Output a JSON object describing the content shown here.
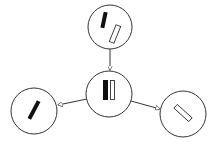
{
  "diagram": {
    "type": "replication-split",
    "colors": {
      "stroke": "#333333",
      "filled": "#111111",
      "hollow": "#ffffff",
      "background": "#ffffff"
    },
    "nodes": [
      {
        "id": "top",
        "cx": 110,
        "cy": 27,
        "r": 22,
        "contents": [
          "filled-bar-tilted",
          "hollow-bar-tilted"
        ]
      },
      {
        "id": "center",
        "cx": 109,
        "cy": 94,
        "r": 23,
        "contents": [
          "filled-bar-vertical",
          "hollow-bar-vertical"
        ]
      },
      {
        "id": "left",
        "cx": 34,
        "cy": 111,
        "r": 23,
        "contents": [
          "filled-bar-tilted"
        ]
      },
      {
        "id": "right",
        "cx": 183,
        "cy": 114,
        "r": 23,
        "contents": [
          "hollow-bar-diagonal"
        ]
      }
    ],
    "edges": [
      {
        "from": "top",
        "to": "center"
      },
      {
        "from": "center",
        "to": "left"
      },
      {
        "from": "center",
        "to": "right"
      }
    ]
  }
}
